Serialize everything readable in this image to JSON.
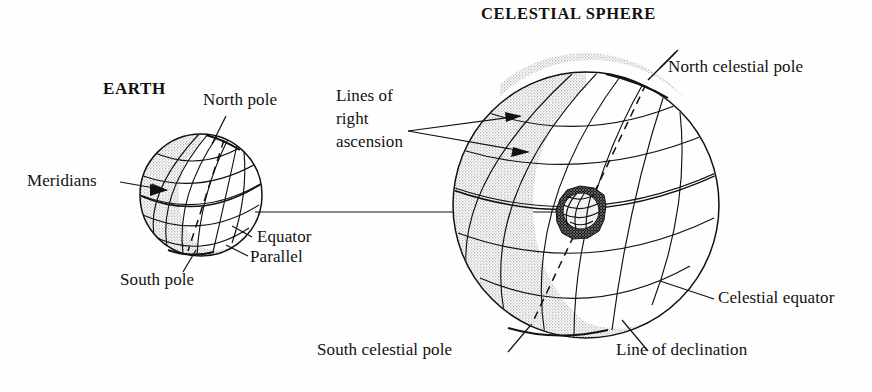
{
  "figure": {
    "kind": "astronomy-diagram",
    "caption_title": "CELESTIAL SPHERE",
    "earth_title": "EARTH"
  },
  "labels": {
    "celestial_sphere": "CELESTIAL SPHERE",
    "earth": "EARTH",
    "north_pole": "North pole",
    "south_pole": "South pole",
    "equator": "Equator",
    "parallel": "Parallel",
    "meridians": "Meridians",
    "lines_of_right_ascension": "Lines of\nright\nascension",
    "north_celestial_pole": "North celestial pole",
    "south_celestial_pole": "South celestial pole",
    "celestial_equator": "Celestial equator",
    "line_of_declination": "Line of declination"
  },
  "colors": {
    "ink": "#111111",
    "paper": "#fefefe",
    "stipple": "#8d8d8d",
    "inner_globe_fill": "#1a1a1a"
  },
  "geometry": {
    "earth_sphere": {
      "cx": 201,
      "cy": 195,
      "r": 61
    },
    "celestial_sphere": {
      "cx": 586,
      "cy": 205,
      "r": 133
    },
    "inner_globe": {
      "cx": 581,
      "cy": 213,
      "r": 24
    },
    "connector_line": {
      "x1": 255,
      "y1": 212,
      "x2": 560,
      "y2": 212
    }
  }
}
